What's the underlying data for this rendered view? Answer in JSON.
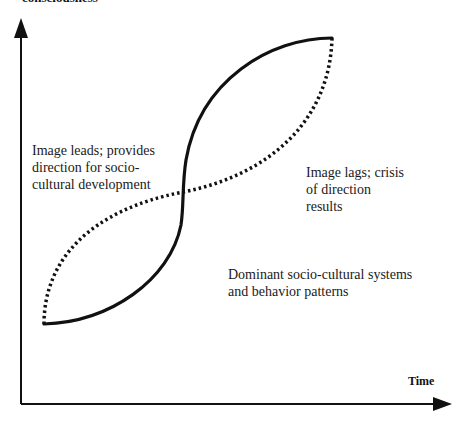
{
  "diagram": {
    "y_axis_label": "consciousness",
    "x_axis_label": "Time",
    "annotations": {
      "left": [
        "Image leads; provides",
        "direction for socio-",
        "cultural development"
      ],
      "right": [
        "Image lags; crisis",
        "of direction",
        "results"
      ],
      "bottom": [
        "Dominant socio-cultural systems",
        "and behavior patterns"
      ]
    },
    "curves": [
      {
        "name": "solid",
        "style": "solid",
        "meaning": "Dominant socio-cultural systems and behavior patterns"
      },
      {
        "name": "dotted",
        "style": "dotted",
        "meaning": "Image"
      }
    ],
    "colors": {
      "line": "#111111",
      "background": "#ffffff"
    }
  }
}
